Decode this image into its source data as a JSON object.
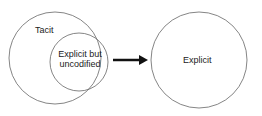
{
  "diagram": {
    "outer_left_label": "Tacit",
    "inner_label_line1": "Explicit but",
    "inner_label_line2": "uncodified",
    "right_label": "Explicit",
    "arrow": "right-arrow",
    "colors": {
      "stroke": "#555555",
      "arrow": "#111111",
      "text": "#222222"
    }
  }
}
